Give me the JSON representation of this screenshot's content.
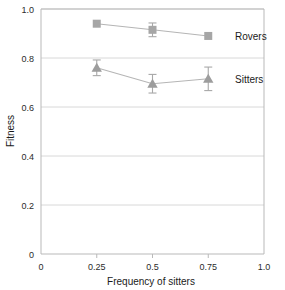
{
  "chart_data": {
    "type": "line",
    "title": "",
    "xlabel": "Frequency of sitters",
    "ylabel": "Fitness",
    "xlim": [
      0,
      1.0
    ],
    "ylim": [
      0,
      1.0
    ],
    "grid": true,
    "grid_axis": "y",
    "legend_position": "inline-right",
    "x": [
      0.25,
      0.5,
      0.75
    ],
    "xticks": [
      "0",
      "0.25",
      "0.5",
      "0.75",
      "1.0"
    ],
    "xtick_values": [
      0,
      0.25,
      0.5,
      0.75,
      1.0
    ],
    "yticks": [
      "0",
      "0.2",
      "0.4",
      "0.6",
      "0.8",
      "1.0"
    ],
    "ytick_values": [
      0,
      0.2,
      0.4,
      0.6,
      0.8,
      1.0
    ],
    "series": [
      {
        "name": "Rovers",
        "marker": "square",
        "color": "#a6a6a6",
        "values": [
          0.94,
          0.915,
          0.89
        ],
        "errors": [
          0.0,
          0.028,
          0.0
        ],
        "label": "Rovers"
      },
      {
        "name": "Sitters",
        "marker": "triangle",
        "color": "#9d9d9d",
        "values": [
          0.76,
          0.695,
          0.715
        ],
        "errors": [
          0.032,
          0.038,
          0.048
        ],
        "label": "Sitters"
      }
    ]
  },
  "axes": {
    "x_title": "Frequency of sitters",
    "y_title": "Fitness"
  },
  "colors": {
    "frame": "#b9b9b9",
    "grid": "#d8d8d8",
    "marker": "#a8a8a8",
    "line": "#b5b5b5",
    "text": "#1a1a1a"
  }
}
